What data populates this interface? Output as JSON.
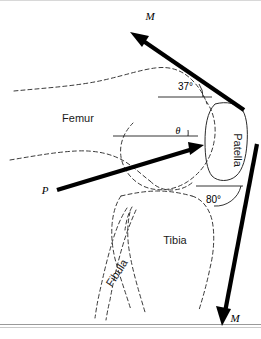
{
  "figure": {
    "name": "knee-joint-free-body-diagram",
    "background_color": "#ffffff",
    "width": 261,
    "height": 339
  },
  "bones": [
    {
      "id": "femur",
      "label": "Femur",
      "rotation": 0,
      "x": 78,
      "y": 122
    },
    {
      "id": "patella",
      "label": "Patella",
      "rotation": 90,
      "x": 234,
      "y": 150
    },
    {
      "id": "tibia",
      "label": "Tibia",
      "rotation": 0,
      "x": 175,
      "y": 244
    },
    {
      "id": "fibula",
      "label": "Fibula",
      "rotation": -57,
      "x": 120,
      "y": 275
    }
  ],
  "forces": [
    {
      "id": "quadriceps-tendon-force",
      "label": "M",
      "label_x": 150,
      "label_y": 20,
      "direction": "up-left",
      "tail": [
        244,
        110
      ],
      "tip": [
        131,
        33
      ]
    },
    {
      "id": "patellofemoral-contact-force",
      "label": "P",
      "label_x": 45,
      "label_y": 194,
      "direction": "up-right",
      "tail": [
        57,
        190
      ],
      "tip": [
        203,
        146
      ]
    },
    {
      "id": "patellar-tendon-force",
      "label": "M",
      "label_x": 235,
      "label_y": 322,
      "direction": "down",
      "tail": [
        256,
        145
      ],
      "tip": [
        223,
        325
      ]
    }
  ],
  "angles": [
    {
      "id": "quadriceps-angle",
      "label": "37°",
      "label_x": 178,
      "label_y": 90,
      "value": 37,
      "unit": "degrees",
      "reference": "horizontal"
    },
    {
      "id": "patellofemoral-angle",
      "label": "θ",
      "label_x": 178,
      "label_y": 147,
      "value": null,
      "unit": "degrees",
      "reference": "horizontal"
    },
    {
      "id": "patellar-tendon-angle",
      "label": "80°",
      "label_x": 212,
      "label_y": 199,
      "value": 80,
      "unit": "degrees",
      "reference": "horizontal"
    }
  ],
  "colors": {
    "vector": "#000000",
    "bone_outline": "#3a3a3a",
    "text": "#1a1a1a",
    "border": "#9a9a9a"
  }
}
